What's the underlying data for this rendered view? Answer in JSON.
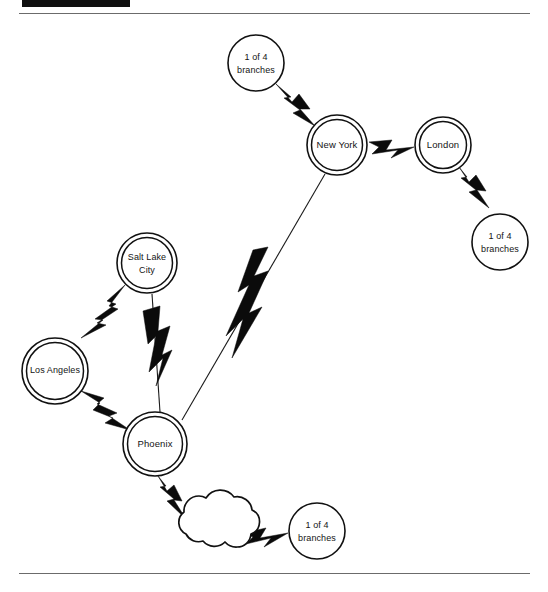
{
  "header": {
    "bar_label": "",
    "caption": ""
  },
  "diagram": {
    "nodes": [
      {
        "id": "branches-north",
        "label_line1": "1 of 4",
        "label_line2": "branches",
        "shape": "circle-single",
        "cx": 256,
        "cy": 49,
        "r": 28
      },
      {
        "id": "new-york",
        "label_line1": "New York",
        "label_line2": "",
        "shape": "circle-double",
        "cx": 337,
        "cy": 131,
        "r": 30
      },
      {
        "id": "london",
        "label_line1": "London",
        "label_line2": "",
        "shape": "circle-double",
        "cx": 443,
        "cy": 131,
        "r": 28
      },
      {
        "id": "branches-east",
        "label_line1": "1 of 4",
        "label_line2": "branches",
        "shape": "circle-single",
        "cx": 500,
        "cy": 228,
        "r": 28
      },
      {
        "id": "salt-lake-city",
        "label_line1": "Salt Lake",
        "label_line2": "City",
        "shape": "circle-double",
        "cx": 147,
        "cy": 249,
        "r": 30
      },
      {
        "id": "los-angeles",
        "label_line1": "Los Angeles",
        "label_line2": "",
        "shape": "circle-double",
        "cx": 55,
        "cy": 357,
        "r": 33
      },
      {
        "id": "phoenix",
        "label_line1": "Phoenix",
        "label_line2": "",
        "shape": "circle-double",
        "cx": 155,
        "cy": 430,
        "r": 32
      },
      {
        "id": "cloud",
        "label_line1": "",
        "label_line2": "",
        "shape": "cloud",
        "cx": 213,
        "cy": 513,
        "r": 0
      },
      {
        "id": "branches-south",
        "label_line1": "1 of 4",
        "label_line2": "branches",
        "shape": "circle-single",
        "cx": 317,
        "cy": 517,
        "r": 28
      }
    ],
    "links": [
      {
        "from": "branches-north",
        "to": "new-york",
        "style": "bolt"
      },
      {
        "from": "new-york",
        "to": "london",
        "style": "bolt"
      },
      {
        "from": "london",
        "to": "branches-east",
        "style": "bolt"
      },
      {
        "from": "new-york",
        "to": "phoenix",
        "style": "line-with-bolt"
      },
      {
        "from": "salt-lake-city",
        "to": "los-angeles",
        "style": "bolt"
      },
      {
        "from": "salt-lake-city",
        "to": "phoenix",
        "style": "line-with-bolt"
      },
      {
        "from": "los-angeles",
        "to": "phoenix",
        "style": "bolt"
      },
      {
        "from": "phoenix",
        "to": "cloud",
        "style": "bolt"
      },
      {
        "from": "cloud",
        "to": "branches-south",
        "style": "bolt"
      }
    ],
    "colors": {
      "ink": "#111111",
      "paper": "#ffffff",
      "rule": "#6b6b6b",
      "header_bar": "#101010"
    }
  }
}
